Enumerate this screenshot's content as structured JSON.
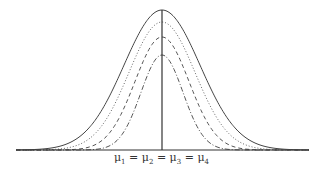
{
  "diagram": {
    "type": "normal-distributions-equal-means",
    "center_label": "μ1 = μ2 = μ3 = μ4",
    "center_label_parts": [
      {
        "sym": "μ",
        "sub": "1"
      },
      {
        "sym": "μ",
        "sub": "2"
      },
      {
        "sym": "μ",
        "sub": "3"
      },
      {
        "sym": "μ",
        "sub": "4"
      }
    ],
    "baseline": {
      "x1": 16,
      "x2": 309,
      "y": 150
    },
    "mean_line": {
      "x": 162,
      "y_top": 10,
      "y_bottom": 150
    },
    "curves": [
      {
        "name": "curve-1",
        "style": "solid",
        "peak_y": 10,
        "sigma_px": 38,
        "color": "#444444"
      },
      {
        "name": "curve-2",
        "style": "dotted",
        "peak_y": 22,
        "sigma_px": 33,
        "color": "#666666"
      },
      {
        "name": "curve-3",
        "style": "dashed",
        "peak_y": 37,
        "sigma_px": 27,
        "color": "#555555"
      },
      {
        "name": "curve-4",
        "style": "dash-dot",
        "peak_y": 55,
        "sigma_px": 21,
        "color": "#555555"
      }
    ]
  }
}
